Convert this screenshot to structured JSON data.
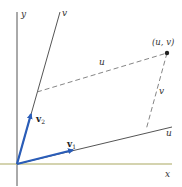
{
  "diagram": {
    "axes": {
      "x_label": "x",
      "y_label": "y",
      "u_axis_label": "u",
      "v_axis_label": "v"
    },
    "point": {
      "label": "(u, v)"
    },
    "dashed_labels": {
      "u": "u",
      "v": "v"
    },
    "vectors": [
      {
        "name": "v",
        "subscript": "1"
      },
      {
        "name": "v",
        "subscript": "2"
      }
    ],
    "colors": {
      "axis": "#555555",
      "x_axis": "#a9a860",
      "vector": "#2a5db8",
      "dashed": "#777777",
      "point": "#222222"
    }
  }
}
